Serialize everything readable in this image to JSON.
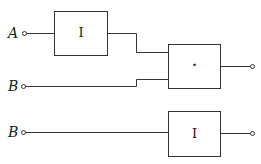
{
  "diagram": {
    "inputs": [
      {
        "label": "A",
        "target": "gate-1"
      },
      {
        "label": "B",
        "target": "gate-2"
      },
      {
        "label": "B",
        "target": "gate-3"
      }
    ],
    "gates": [
      {
        "id": "gate-1",
        "symbol": "I"
      },
      {
        "id": "gate-2",
        "symbol": "·"
      },
      {
        "id": "gate-3",
        "symbol": "I"
      }
    ],
    "colors": {
      "line": "#333333",
      "background": "#ffffff"
    }
  }
}
